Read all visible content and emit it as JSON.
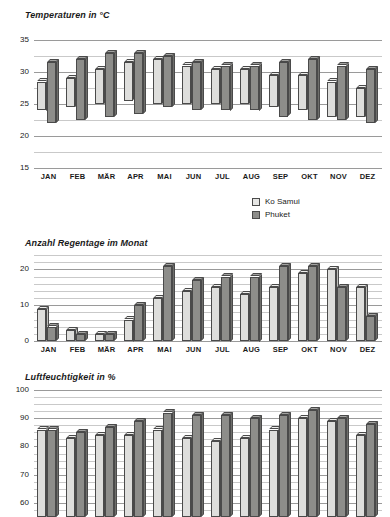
{
  "legend": {
    "position": "top-right-of-rain-chart",
    "entries": [
      {
        "label": "Ko Samui",
        "color": "#e6e6e4",
        "key": "ko_samui"
      },
      {
        "label": "Phuket",
        "color": "#8d8d8a",
        "key": "phuket"
      }
    ]
  },
  "months": [
    "JAN",
    "FEB",
    "MÄR",
    "APR",
    "MAI",
    "JUN",
    "JUL",
    "AUG",
    "SEP",
    "OKT",
    "NOV",
    "DEZ"
  ],
  "chart_data": [
    {
      "id": "temperature",
      "type": "bar",
      "subtype": "floating-range-bar",
      "title": "Temperaturen in °C",
      "xlabel": "",
      "ylabel": "",
      "ylim": [
        15,
        35
      ],
      "yticks": [
        15,
        20,
        25,
        30,
        35
      ],
      "ytick_labels": [
        "15",
        "20",
        "25",
        "30",
        "35"
      ],
      "minor_gridlines": true,
      "minor_step": 2.5,
      "grid": true,
      "legend_position": "none",
      "categories": [
        "JAN",
        "FEB",
        "MÄR",
        "APR",
        "MAI",
        "JUN",
        "JUL",
        "AUG",
        "SEP",
        "OKT",
        "NOV",
        "DEZ"
      ],
      "series": [
        {
          "name": "Ko Samui",
          "color": "#dededc",
          "low": [
            24.0,
            24.5,
            25.0,
            25.5,
            25.0,
            25.0,
            25.0,
            25.0,
            24.5,
            24.0,
            23.0,
            23.0
          ],
          "high": [
            28.5,
            29.0,
            30.5,
            31.5,
            32.0,
            31.0,
            30.5,
            30.5,
            29.5,
            29.5,
            28.5,
            27.5
          ]
        },
        {
          "name": "Phuket",
          "color": "#8d8d8a",
          "low": [
            22.0,
            22.5,
            23.0,
            23.5,
            24.5,
            24.0,
            24.0,
            24.0,
            23.0,
            22.5,
            22.5,
            22.0
          ],
          "high": [
            31.5,
            32.0,
            33.0,
            33.0,
            32.5,
            31.5,
            31.0,
            31.0,
            31.5,
            32.0,
            31.0,
            30.5
          ]
        }
      ]
    },
    {
      "id": "rain_days",
      "type": "bar",
      "title": "Anzahl Regentage im Monat",
      "xlabel": "",
      "ylabel": "",
      "ylim": [
        0,
        24
      ],
      "yticks": [
        0,
        10,
        20
      ],
      "ytick_labels": [
        "0",
        "10",
        "20"
      ],
      "minor_gridlines": true,
      "minor_step": 2,
      "grid": true,
      "legend_position": "top-right",
      "categories": [
        "JAN",
        "FEB",
        "MÄR",
        "APR",
        "MAI",
        "JUN",
        "JUL",
        "AUG",
        "SEP",
        "OKT",
        "NOV",
        "DEZ"
      ],
      "series": [
        {
          "name": "Ko Samui",
          "color": "#dededc",
          "values": [
            9,
            3,
            2,
            6,
            12,
            14,
            15,
            13,
            15,
            19,
            20,
            15
          ]
        },
        {
          "name": "Phuket",
          "color": "#8d8d8a",
          "values": [
            4,
            2,
            2,
            10,
            21,
            17,
            18,
            18,
            21,
            21,
            15,
            7
          ]
        }
      ]
    },
    {
      "id": "humidity",
      "type": "bar",
      "title": "Luftfeuchtigkeit in %",
      "xlabel": "",
      "ylabel": "",
      "ylim": [
        55,
        100
      ],
      "yticks": [
        60,
        70,
        80,
        90,
        100
      ],
      "ytick_labels": [
        "60",
        "70",
        "80",
        "90",
        "100"
      ],
      "minor_gridlines": true,
      "minor_step": 2.5,
      "grid": true,
      "legend_position": "none",
      "categories": [
        "JAN",
        "FEB",
        "MÄR",
        "APR",
        "MAI",
        "JUN",
        "JUL",
        "AUG",
        "SEP",
        "OKT",
        "NOV",
        "DEZ"
      ],
      "series": [
        {
          "name": "Ko Samui",
          "color": "#dededc",
          "values": [
            86,
            83,
            84,
            84,
            86,
            83,
            82,
            83,
            86,
            90,
            89,
            84
          ]
        },
        {
          "name": "Phuket",
          "color": "#8d8d8a",
          "values": [
            86,
            85,
            87,
            89,
            92,
            91,
            91,
            90,
            91,
            93,
            90,
            88
          ]
        }
      ]
    }
  ]
}
